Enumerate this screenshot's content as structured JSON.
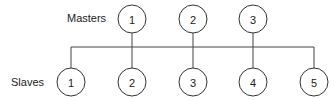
{
  "labels": {
    "masters": "Masters",
    "slaves": "Slaves"
  },
  "masters": [
    {
      "label": "1",
      "x": 132,
      "y": 19
    },
    {
      "label": "2",
      "x": 193,
      "y": 19
    },
    {
      "label": "3",
      "x": 253,
      "y": 19
    }
  ],
  "slaves": [
    {
      "label": "1",
      "x": 71,
      "y": 82
    },
    {
      "label": "2",
      "x": 132,
      "y": 82
    },
    {
      "label": "3",
      "x": 193,
      "y": 82
    },
    {
      "label": "4",
      "x": 253,
      "y": 82
    },
    {
      "label": "5",
      "x": 314,
      "y": 82
    }
  ],
  "bus": {
    "y": 47,
    "x_start": 71,
    "x_end": 314
  },
  "node_radius": 14,
  "colors": {
    "stroke": "#333333",
    "line": "#444444",
    "text": "#222222"
  }
}
